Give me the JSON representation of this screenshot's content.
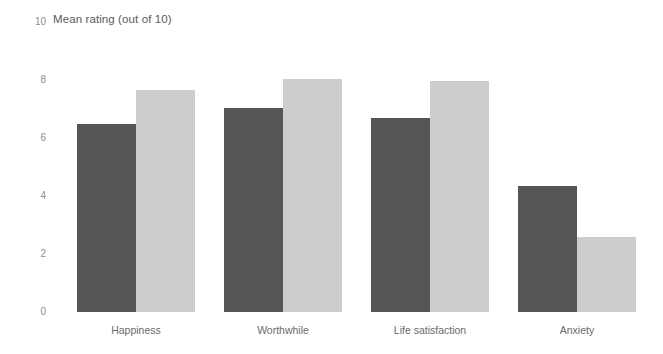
{
  "chart_data": {
    "type": "bar",
    "title": "Mean rating (out of 10)",
    "xlabel": "",
    "ylabel": "",
    "ylim": [
      0,
      10
    ],
    "yticks": [
      0,
      2,
      4,
      6,
      8,
      10
    ],
    "ytick_labels": [
      "0",
      "2",
      "4",
      "6",
      "8",
      "10"
    ],
    "grid": false,
    "legend": "none",
    "categories": [
      "Happiness",
      "Worthwhile",
      "Life satisfaction",
      "Anxiety"
    ],
    "series": [
      {
        "name": "series-a",
        "color": "#555555",
        "values": [
          6.5,
          7.05,
          6.7,
          4.35
        ]
      },
      {
        "name": "series-b",
        "color": "#cdcdcd",
        "values": [
          7.65,
          8.05,
          7.95,
          2.6
        ]
      }
    ]
  },
  "colors": {
    "series_a": "#555555",
    "series_b": "#cdcdcd",
    "tick_text": "#8e8e8e",
    "label_text": "#6a6a6a",
    "title_text": "#5a5a5a",
    "background": "#ffffff"
  }
}
